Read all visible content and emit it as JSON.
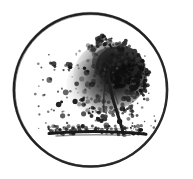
{
  "artwork": {
    "title": "Tree in circle emblem",
    "description": "Hand-drawn stippled ink illustration of a windblown tree inside a thin circular border",
    "medium": "pen-and-ink stipple",
    "background_color": "#ffffff",
    "ink_color": "#1a1a1a"
  },
  "canvas": {
    "width": 193,
    "height": 179
  },
  "circle_border": {
    "name": "circle-frame",
    "center_x": 90.5,
    "center_y": 90.0,
    "radius": 77.0,
    "stroke_width": 2.4,
    "color": "#1f1f1f"
  },
  "tree": {
    "canopy": {
      "name": "foliage-canopy",
      "center_x": 107,
      "center_y": 78,
      "radius_x": 41,
      "radius_y": 38,
      "top_y": 44,
      "bottom_y": 122,
      "left_x": 56,
      "right_x": 149,
      "dense_side": "right",
      "color_dark": "#141414",
      "color_mid": "#3d3d3d",
      "color_light": "#6e6e6e"
    },
    "trunk": {
      "name": "tree-trunk",
      "top_x": 108,
      "top_y": 72,
      "base_x": 123,
      "base_y": 134,
      "width_top": 2.0,
      "width_base": 4.0,
      "color": "#1c1c1c"
    },
    "ground_line": {
      "name": "ground-line",
      "start_x": 48,
      "end_x": 147,
      "y": 133,
      "thickness": 3.0,
      "color": "#1a1a1a"
    },
    "scatter": {
      "name": "blown-leaves",
      "drift_direction": "left",
      "min_x": 34,
      "max_x": 160,
      "min_y": 52,
      "max_y": 132,
      "count": 470
    }
  }
}
